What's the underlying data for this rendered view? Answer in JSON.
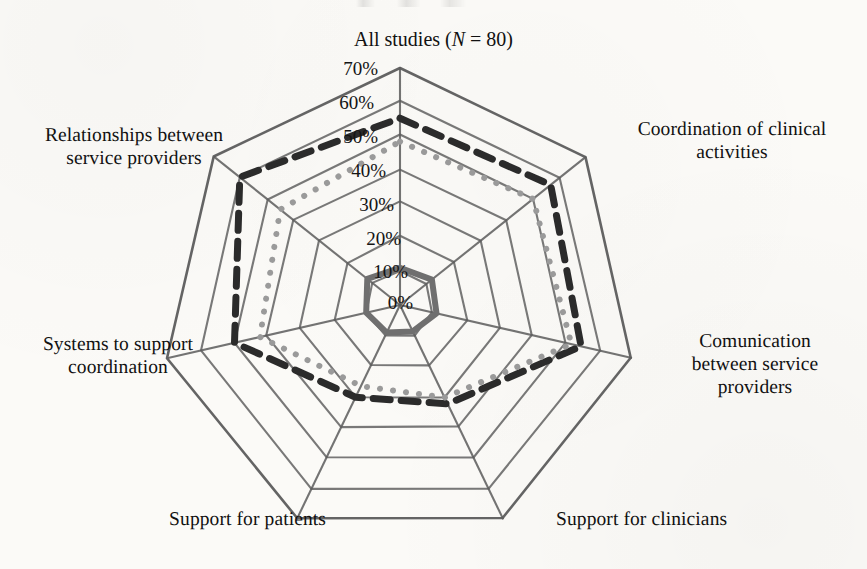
{
  "figure": {
    "title_prefix": "All studies (",
    "title_italic": "N",
    "title_suffix": " = 80)",
    "title_full": "All studies (N = 80)",
    "background_color": "#fbfaf7",
    "ink_color": "#1d1d1d"
  },
  "chart_data": {
    "type": "radar",
    "title": "All studies (N = 80)",
    "xlabel": "",
    "ylabel": "",
    "grid": true,
    "legend_position": "none",
    "rlim": [
      0,
      70
    ],
    "r_tick_step": 10,
    "r_tick_labels": [
      "0%",
      "10%",
      "20%",
      "30%",
      "40%",
      "50%",
      "60%",
      "70%"
    ],
    "r_tick_values": [
      0,
      10,
      20,
      30,
      40,
      50,
      60,
      70
    ],
    "categories": [
      "All studies (N = 80)",
      "Coordination of clinical activities",
      "Comunication between service providers",
      "Support for clinicians",
      "Support for patients",
      "Systems to support coordination",
      "Relationships between service providers"
    ],
    "series": [
      {
        "name": "dashed-series",
        "style": "dashed",
        "color": "#2b2b2b",
        "width": 7,
        "values": [
          55,
          57,
          55,
          32,
          30,
          50,
          60
        ]
      },
      {
        "name": "dotted-series",
        "style": "dotted",
        "color": "#9a9a9a",
        "width": 6,
        "values": [
          48,
          50,
          52,
          30,
          26,
          42,
          45
        ]
      },
      {
        "name": "solid-inner-series",
        "style": "solid",
        "color": "#6f6f6f",
        "width": 6,
        "values": [
          11,
          12,
          11,
          9,
          9,
          10,
          12
        ]
      }
    ]
  },
  "axis_labels": [
    {
      "id": "axis-label-all-studies",
      "text": "All studies (N = 80)"
    },
    {
      "id": "axis-label-coordination",
      "text": "Coordination of clinical\nactivities"
    },
    {
      "id": "axis-label-comunication",
      "text": "Comunication\nbetween service\nproviders"
    },
    {
      "id": "axis-label-support-clinicians",
      "text": "Support for clinicians"
    },
    {
      "id": "axis-label-support-patients",
      "text": "Support for patients"
    },
    {
      "id": "axis-label-systems",
      "text": "Systems to support\ncoordination"
    },
    {
      "id": "axis-label-relationships",
      "text": "Relationships between\nservice providers"
    }
  ],
  "tick_labels": {
    "t0": "0%",
    "t10": "10%",
    "t20": "20%",
    "t30": "30%",
    "t40": "40%",
    "t50": "50%",
    "t60": "60%",
    "t70": "70%"
  }
}
